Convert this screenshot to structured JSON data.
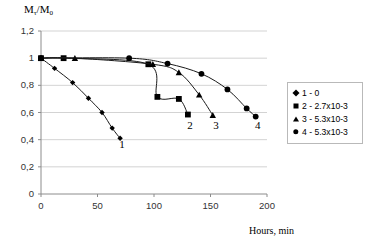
{
  "chart_data": {
    "type": "line",
    "title": "",
    "ylabel": "Mτ/M0",
    "ylabel_main": "M",
    "ylabel_sub1": "τ",
    "ylabel_mid": "/M",
    "ylabel_sub2": "0",
    "xlabel": "Hours, min",
    "xlim": [
      0,
      200
    ],
    "ylim": [
      0,
      1.2
    ],
    "xticks": [
      0,
      50,
      100,
      150,
      200
    ],
    "xtick_labels": [
      "0",
      "50",
      "100",
      "150",
      "200"
    ],
    "yticks": [
      0,
      0.2,
      0.4,
      0.6,
      0.8,
      1,
      1.2
    ],
    "ytick_labels": [
      "0",
      "0,2",
      "0,4",
      "0,6",
      "0,8",
      "1",
      "1,2"
    ],
    "grid": "horizontal",
    "grid_color": "#c8c8c8",
    "line_color": "#1a1a1a",
    "marker_color": "#000000",
    "legend_position": "right",
    "series": [
      {
        "name": "1 - 0",
        "number": "1",
        "marker": "diamond",
        "points": [
          {
            "x": 0,
            "y": 1.0
          },
          {
            "x": 12,
            "y": 0.925
          },
          {
            "x": 28,
            "y": 0.82
          },
          {
            "x": 42,
            "y": 0.705
          },
          {
            "x": 54,
            "y": 0.6
          },
          {
            "x": 63,
            "y": 0.485
          },
          {
            "x": 70,
            "y": 0.41
          }
        ]
      },
      {
        "name": "2 - 2.7x10-3",
        "number": "2",
        "marker": "square",
        "points": [
          {
            "x": 0,
            "y": 1.0
          },
          {
            "x": 20,
            "y": 1.0
          },
          {
            "x": 95,
            "y": 0.955
          },
          {
            "x": 103,
            "y": 0.715
          },
          {
            "x": 122,
            "y": 0.7
          },
          {
            "x": 130,
            "y": 0.585
          }
        ]
      },
      {
        "name": "3 - 5.3x10-3",
        "number": "3",
        "marker": "triangle",
        "points": [
          {
            "x": 0,
            "y": 1.0
          },
          {
            "x": 30,
            "y": 1.0
          },
          {
            "x": 99,
            "y": 0.955
          },
          {
            "x": 122,
            "y": 0.895
          },
          {
            "x": 140,
            "y": 0.73
          },
          {
            "x": 152,
            "y": 0.58
          }
        ]
      },
      {
        "name": "4 - 5.3x10-3",
        "number": "4",
        "marker": "circle",
        "points": [
          {
            "x": 0,
            "y": 1.0
          },
          {
            "x": 78,
            "y": 1.0
          },
          {
            "x": 112,
            "y": 0.96
          },
          {
            "x": 142,
            "y": 0.885
          },
          {
            "x": 165,
            "y": 0.77
          },
          {
            "x": 182,
            "y": 0.63
          },
          {
            "x": 190,
            "y": 0.57
          }
        ]
      }
    ],
    "curve_labels": [
      {
        "text": "1",
        "x": 72,
        "y": 0.36
      },
      {
        "text": "2",
        "x": 132,
        "y": 0.5
      },
      {
        "text": "3",
        "x": 155,
        "y": 0.5
      },
      {
        "text": "4",
        "x": 192,
        "y": 0.5
      }
    ],
    "legend": [
      {
        "marker": "diamond",
        "label": "1 - 0"
      },
      {
        "marker": "square",
        "label": "2 - 2.7x10-3"
      },
      {
        "marker": "triangle",
        "label": "3 - 5.3x10-3"
      },
      {
        "marker": "circle",
        "label": "4 - 5.3x10-3"
      }
    ]
  }
}
